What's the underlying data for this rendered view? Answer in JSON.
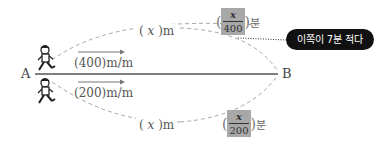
{
  "points": {
    "start": "A",
    "end": "B"
  },
  "upper_path": {
    "distance_label": {
      "open": "(",
      "var": "x",
      "close": ")m"
    },
    "time_label": {
      "numerator": "x",
      "denominator": "400",
      "unit": "분"
    },
    "speed_label": "(400)m/m"
  },
  "lower_path": {
    "distance_label": {
      "open": "(",
      "var": "x",
      "close": ")m"
    },
    "time_label": {
      "numerator": "x",
      "denominator": "200",
      "unit": "분"
    },
    "speed_label": "(200)m/m"
  },
  "callout": {
    "text": "이쪽이 7분 적다"
  },
  "icons": [
    "walking-person-icon",
    "walking-person-icon",
    "arrow-right-icon",
    "arrow-right-icon"
  ],
  "colors": {
    "line": "#555555",
    "dashed": "#aaaaaa",
    "callout_bg": "#111111",
    "fraction_bg": "#a8a8a8"
  }
}
